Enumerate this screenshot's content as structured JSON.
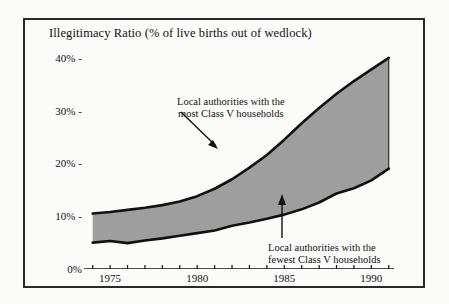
{
  "figure": {
    "title": "Illegitimacy Ratio (% of live births out of wedlock)",
    "frame_color": "#2a2a2a",
    "background_color": "#fbfbfa"
  },
  "annotations": {
    "upper": {
      "line1": "Local authorities with the",
      "line2": "most Class V households",
      "arrow_name": "upper-annotation-arrow"
    },
    "lower": {
      "line1": "Local authorities with the",
      "line2": "fewest Class V households",
      "arrow_name": "lower-annotation-arrow"
    }
  },
  "chart_data": {
    "type": "area",
    "title": "Illegitimacy Ratio (% of live births out of wedlock)",
    "xlabel": "",
    "ylabel": "",
    "xlim": [
      1973.5,
      1991.3
    ],
    "ylim": [
      0,
      43
    ],
    "yticks": [
      0,
      10,
      20,
      30,
      40
    ],
    "ytick_labels": [
      "0%",
      "10%",
      "20%",
      "30%",
      "40%"
    ],
    "xticks": [
      1975,
      1980,
      1985,
      1990
    ],
    "xtick_labels": [
      "1975",
      "1980",
      "1985",
      "1990"
    ],
    "minor_xticks": [
      1974,
      1975,
      1976,
      1977,
      1978,
      1979,
      1980,
      1981,
      1982,
      1983,
      1984,
      1985,
      1986,
      1987,
      1988,
      1989,
      1990,
      1991
    ],
    "grid": false,
    "legend_position": "none",
    "fill_color": "#9e9e9e",
    "line_color": "#111111",
    "x": [
      1974,
      1975,
      1976,
      1977,
      1978,
      1979,
      1980,
      1981,
      1982,
      1983,
      1984,
      1985,
      1986,
      1987,
      1988,
      1989,
      1990,
      1991
    ],
    "series": [
      {
        "name": "Local authorities with the most Class V households",
        "values": [
          10.5,
          10.8,
          11.2,
          11.6,
          12.1,
          12.8,
          13.8,
          15.2,
          17.0,
          19.2,
          21.6,
          24.5,
          27.6,
          30.5,
          33.2,
          35.6,
          37.8,
          40.0
        ]
      },
      {
        "name": "Local authorities with the fewest Class V households",
        "values": [
          5.0,
          5.3,
          4.9,
          5.4,
          5.8,
          6.3,
          6.8,
          7.3,
          8.2,
          8.8,
          9.5,
          10.3,
          11.3,
          12.6,
          14.3,
          15.3,
          16.8,
          19.0
        ]
      }
    ]
  }
}
